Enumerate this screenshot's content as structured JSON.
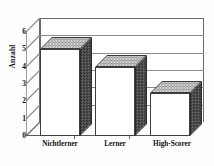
{
  "chart_data": {
    "type": "bar",
    "title": "",
    "subtitle": "",
    "xlabel": "",
    "ylabel": "Anzahl",
    "categories": [
      "Nichtlerner",
      "Lerner",
      "High-Scorer"
    ],
    "values": [
      5,
      4,
      2.5
    ],
    "series": [
      {
        "name": "Anzahl",
        "values": [
          5,
          4,
          2.5
        ]
      }
    ],
    "ylim": [
      0,
      6
    ],
    "yticks": [
      0,
      1,
      2,
      3,
      4,
      5,
      6
    ],
    "ytick_labels": [
      "0",
      "1",
      "2",
      "3",
      "4",
      "5",
      "6"
    ],
    "grid": true,
    "grid_axis": "y",
    "legend": false,
    "legend_position": "none",
    "style": "3d-column-grayscale",
    "colors": {
      "bar_front": "#ffffff",
      "bar_side": "#4a4a4a",
      "bar_top": "#bdbdbd",
      "outline": "#333333",
      "gridline": "#8a8a8a",
      "axis": "#6a6a6a",
      "text": "#111111",
      "background": "#ffffff"
    }
  }
}
